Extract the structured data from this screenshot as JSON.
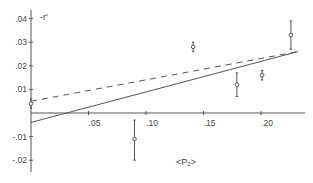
{
  "chart_data": {
    "type": "scatter",
    "title": "",
    "xlabel": "<P₂>",
    "ylabel": "-r'",
    "xlim": [
      0,
      0.23
    ],
    "ylim": [
      -0.025,
      0.045
    ],
    "grid": false,
    "x_ticks": [
      {
        "value": 0.05,
        "label": ".05"
      },
      {
        "value": 0.1,
        "label": ".10"
      },
      {
        "value": 0.15,
        "label": ".15"
      },
      {
        "value": 0.2,
        "label": ".20"
      }
    ],
    "y_ticks": [
      {
        "value": 0.04,
        "label": ".04"
      },
      {
        "value": 0.03,
        "label": ".03"
      },
      {
        "value": 0.02,
        "label": ".02"
      },
      {
        "value": 0.01,
        "label": ".01"
      },
      {
        "value": -0.01,
        "label": "-.01"
      },
      {
        "value": -0.02,
        "label": "-.02"
      }
    ],
    "points": [
      {
        "x": 0.0,
        "y": 0.004,
        "err_low": 0.002,
        "err_high": 0.006
      },
      {
        "x": 0.09,
        "y": -0.011,
        "err_low": -0.02,
        "err_high": -0.003
      },
      {
        "x": 0.141,
        "y": 0.028,
        "err_low": 0.026,
        "err_high": 0.03
      },
      {
        "x": 0.179,
        "y": 0.012,
        "err_low": 0.007,
        "err_high": 0.017
      },
      {
        "x": 0.201,
        "y": 0.016,
        "err_low": 0.014,
        "err_high": 0.018
      },
      {
        "x": 0.226,
        "y": 0.033,
        "err_low": 0.027,
        "err_high": 0.039
      }
    ],
    "lines": [
      {
        "name": "dashed fit",
        "style": "dashed",
        "x": [
          0.0,
          0.232
        ],
        "y": [
          0.005,
          0.026
        ]
      },
      {
        "name": "solid fit",
        "style": "solid",
        "x": [
          0.0,
          0.232
        ],
        "y": [
          -0.004,
          0.026
        ]
      }
    ],
    "legend": []
  }
}
